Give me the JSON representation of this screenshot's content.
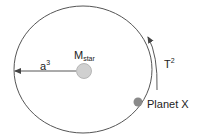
{
  "diagram": {
    "type": "orbit",
    "labels": {
      "star": {
        "base": "M",
        "sub": "star"
      },
      "semi_major_axis": {
        "base": "a",
        "sup": "3"
      },
      "period": {
        "base": "T",
        "sup": "2"
      },
      "planet": "Planet X"
    },
    "colors": {
      "orbit": "#555555",
      "star_fill": "#d0d0d0",
      "planet_fill": "#8a8a8a",
      "text": "#222222"
    }
  }
}
